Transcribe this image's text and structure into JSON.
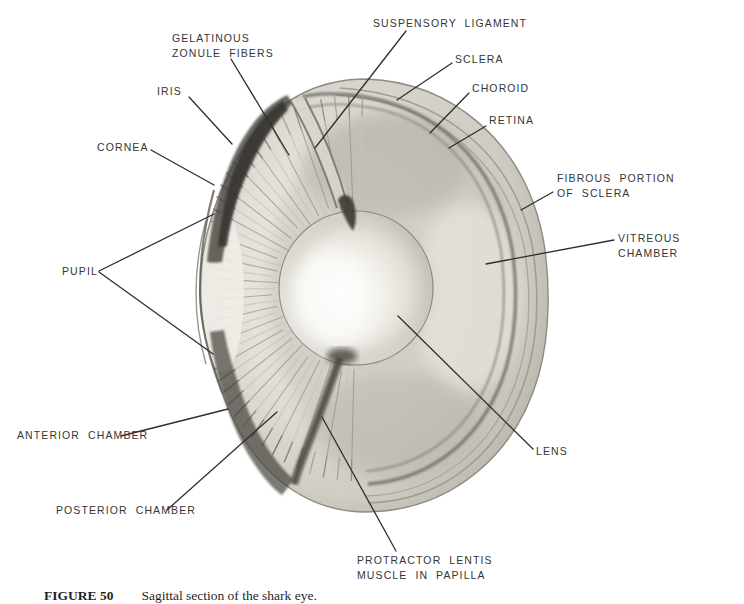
{
  "figure": {
    "caption": {
      "number": "FIGURE 50",
      "text": "Sagittal section of the shark eye."
    },
    "labels": {
      "suspensory_ligament": "SUSPENSORY LIGAMENT",
      "gelatinous_zonule_fibers": "GELATINOUS\nZONULE FIBERS",
      "iris": "IRIS",
      "sclera": "SCLERA",
      "choroid": "CHOROID",
      "retina": "RETINA",
      "cornea": "CORNEA",
      "fibrous_portion_of_sclera": "FIBROUS PORTION\nOF SCLERA",
      "vitreous_chamber": "VITREOUS CHAMBER",
      "pupil": "PUPIL",
      "anterior_chamber": "ANTERIOR CHAMBER",
      "posterior_chamber": "POSTERIOR CHAMBER",
      "lens": "LENS",
      "protractor_lentis": "PROTRACTOR LENTIS\nMUSCLE IN PAPILLA"
    },
    "ink_color": "#2f2f2f",
    "paper_color": "#ffffff",
    "illustration": "graphite pencil drawing of a sagittally sectioned eye, three-quarter view"
  }
}
